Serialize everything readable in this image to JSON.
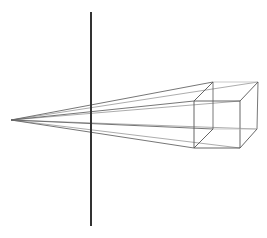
{
  "diagram": {
    "title": "",
    "type": "perspective-projection",
    "background": "#ffffff",
    "eye_point": [
      11,
      120
    ],
    "projection_plane": {
      "x": 91,
      "y_top": 12,
      "y_bottom": 226,
      "color": "#333333",
      "width": 2
    },
    "cube": {
      "front": {
        "tl": [
          194,
          101
        ],
        "tr": [
          240,
          101
        ],
        "br": [
          240,
          148
        ],
        "bl": [
          194,
          148
        ]
      },
      "back": {
        "tl": [
          213,
          82
        ],
        "tr": [
          258,
          82
        ],
        "br": [
          257,
          129
        ],
        "bl": [
          213,
          129
        ]
      },
      "edge_color": "#555555",
      "hidden_edge_color": "#bbbbbb"
    },
    "rays": {
      "color": "#666666",
      "targets": [
        [
          213,
          82
        ],
        [
          194,
          101
        ],
        [
          194,
          148
        ],
        [
          213,
          129
        ],
        [
          258,
          82
        ],
        [
          240,
          101
        ],
        [
          240,
          148
        ],
        [
          257,
          129
        ]
      ]
    }
  }
}
